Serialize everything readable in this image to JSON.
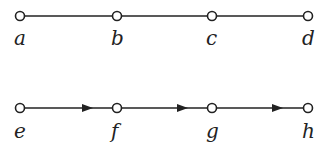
{
  "diagram": {
    "rows": [
      {
        "directed": false,
        "y": 16,
        "nodes": [
          {
            "id": "a",
            "label": "a",
            "x": 20
          },
          {
            "id": "b",
            "label": "b",
            "x": 117
          },
          {
            "id": "c",
            "label": "c",
            "x": 212
          },
          {
            "id": "d",
            "label": "d",
            "x": 308
          }
        ]
      },
      {
        "directed": true,
        "y": 108,
        "nodes": [
          {
            "id": "e",
            "label": "e",
            "x": 20
          },
          {
            "id": "f",
            "label": "f",
            "x": 117
          },
          {
            "id": "g",
            "label": "g",
            "x": 212
          },
          {
            "id": "h",
            "label": "h",
            "x": 308
          }
        ]
      }
    ],
    "colors": {
      "stroke": "#222222",
      "node_fill": "#ffffff"
    }
  }
}
